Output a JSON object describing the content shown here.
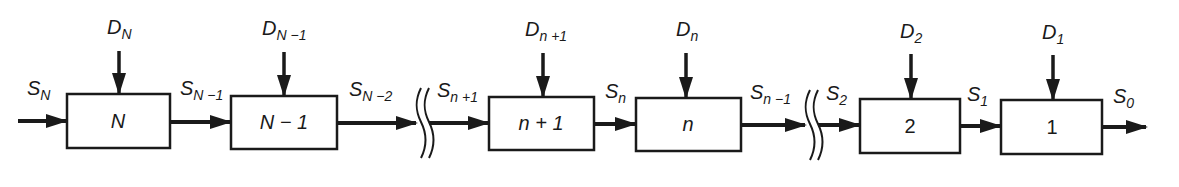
{
  "diagram": {
    "colors": {
      "ink": "#1a1a1a",
      "background": "#ffffff"
    },
    "stages": [
      {
        "id": "N",
        "label": "N",
        "italic": true,
        "decision": {
          "main": "D",
          "sub": "N"
        },
        "input_state": {
          "main": "S",
          "sub": "N"
        },
        "output_state": {
          "main": "S",
          "sub": "N−1"
        }
      },
      {
        "id": "N-1",
        "label": "N − 1",
        "italic": true,
        "decision": {
          "main": "D",
          "sub": "N−1"
        },
        "input_state": {
          "main": "S",
          "sub": "N−1"
        },
        "output_state": {
          "main": "S",
          "sub": "N−2"
        }
      },
      {
        "id": "n+1",
        "label": "n + 1",
        "italic": true,
        "decision": {
          "main": "D",
          "sub": "n+1"
        },
        "input_state": {
          "main": "S",
          "sub": "n+1"
        },
        "output_state": {
          "main": "S",
          "sub": "n"
        }
      },
      {
        "id": "n",
        "label": "n",
        "italic": true,
        "decision": {
          "main": "D",
          "sub": "n"
        },
        "input_state": {
          "main": "S",
          "sub": "n"
        },
        "output_state": {
          "main": "S",
          "sub": "n−1"
        }
      },
      {
        "id": "2",
        "label": "2",
        "italic": false,
        "decision": {
          "main": "D",
          "sub": "2"
        },
        "input_state": {
          "main": "S",
          "sub": "2"
        },
        "output_state": {
          "main": "S",
          "sub": "1"
        }
      },
      {
        "id": "1",
        "label": "1",
        "italic": false,
        "decision": {
          "main": "D",
          "sub": "1"
        },
        "input_state": {
          "main": "S",
          "sub": "1"
        },
        "output_state": {
          "main": "S",
          "sub": "0"
        }
      }
    ],
    "breaks": [
      {
        "after_state": "S_{N-2}",
        "before_state": "S_{n+1}"
      },
      {
        "after_state": "S_{n-1}",
        "before_state": "S_2"
      }
    ],
    "state_labels": {
      "s_N": {
        "main": "S",
        "sub": "N"
      },
      "s_N1": {
        "main": "S",
        "sub": "N −1"
      },
      "s_N2": {
        "main": "S",
        "sub": "N −2"
      },
      "s_n1p": {
        "main": "S",
        "sub": "n +1"
      },
      "s_n": {
        "main": "S",
        "sub": "n"
      },
      "s_n1m": {
        "main": "S",
        "sub": "n −1"
      },
      "s_2": {
        "main": "S",
        "sub": "2"
      },
      "s_1": {
        "main": "S",
        "sub": "1"
      },
      "s_0": {
        "main": "S",
        "sub": "0"
      }
    },
    "decision_labels": {
      "d_N": {
        "main": "D",
        "sub": "N"
      },
      "d_N1": {
        "main": "D",
        "sub": "N −1"
      },
      "d_n1p": {
        "main": "D",
        "sub": "n +1"
      },
      "d_n": {
        "main": "D",
        "sub": "n"
      },
      "d_2": {
        "main": "D",
        "sub": "2"
      },
      "d_1": {
        "main": "D",
        "sub": "1"
      }
    },
    "box_labels": {
      "b_N": "N",
      "b_N1": "N − 1",
      "b_n1p": "n + 1",
      "b_n": "n",
      "b_2": "2",
      "b_1": "1"
    }
  }
}
